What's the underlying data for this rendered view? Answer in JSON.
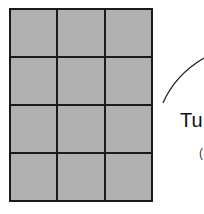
{
  "grid": {
    "rows": 4,
    "cols": 3,
    "fill_color": "#b0b0b0",
    "line_color": "#1a1a1a"
  },
  "annotation": {
    "label": "Tu",
    "sub_label": "("
  }
}
